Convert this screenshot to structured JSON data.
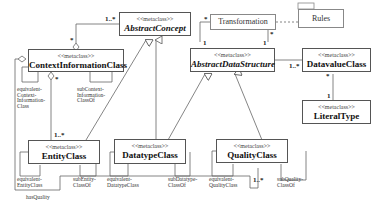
{
  "diagram": {
    "classes": {
      "abstract_concept": {
        "stereotype": "<<metaclass>>",
        "name": "AbstractConcept"
      },
      "context_information": {
        "stereotype": "<<metaclass>>",
        "name": "ContextInformationClass"
      },
      "abstract_data_structure": {
        "stereotype": "<<metaclass>>",
        "name": "AbstractDataStructure"
      },
      "datavalue": {
        "stereotype": "<<metaclass>>",
        "name": "DatavalueClass"
      },
      "literal_type": {
        "stereotype": "<<metaclass>>",
        "name": "LiteralType"
      },
      "entity": {
        "stereotype": "<<metaclass>>",
        "name": "EntityClass"
      },
      "datatype": {
        "stereotype": "<<metaclass>>",
        "name": "DatatypeClass"
      },
      "quality": {
        "stereotype": "<<metaclass>>",
        "name": "QualityClass"
      },
      "transformation": {
        "name": "Transformation"
      },
      "rules": {
        "name": "Rules"
      }
    },
    "edge_labels": {
      "equivalent_context": "equivalent-\nContext-\nInformation-\nClass",
      "sub_context": "subContext-\nInformation-\nClassOf",
      "equivalent_entity": "equivalent-\nEntityClass",
      "sub_entity": "subEntity-\nClassOf",
      "equivalent_datatype": "equivalent-\nDatatypeClass",
      "sub_datatype": "subDatatype-\nClassOf",
      "equivalent_quality": "equivalent-\nQualityClass",
      "sub_quality": "subQuality-\nClassOf",
      "has_quality": "hasQuality"
    },
    "multiplicities": {
      "ac_context_top": "1..*",
      "ac_context_bottom": "*",
      "context_entity_star": "*",
      "entity_top": "1..*",
      "transf_left_star": "*",
      "transf_left_one": "1",
      "transf_right_star": "*",
      "transf_right_one": "1",
      "ads_datavalue": "1..*",
      "datavalue_bottom": "*",
      "literal_top": "1",
      "quality_bottom": "1..*"
    }
  }
}
